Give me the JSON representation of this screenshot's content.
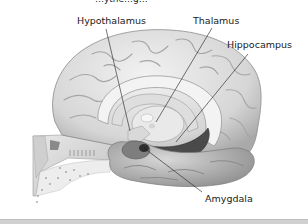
{
  "title_partial": "…ythe…g…",
  "labels": {
    "hypothalamus": "Hypothalamus",
    "thalamus": "Thalamus",
    "hippocampus": "Hippocampus",
    "amygdala": "Amygdala"
  },
  "colors": {
    "background": "#ffffff",
    "brain_light": "#e6e6e6",
    "brain_mid": "#bdbdbd",
    "brain_dark": "#6e6e6e",
    "hippocampus_dark": "#3c3c3c",
    "leader_line": "#1a1a1a",
    "bottom_bar": "#d0d0d0"
  }
}
